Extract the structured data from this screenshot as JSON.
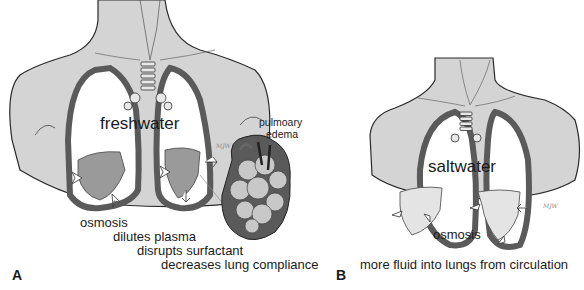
{
  "panels": [
    {
      "id": "A",
      "label": "A",
      "title": "freshwater",
      "inset_label": "pulmoary\nedema",
      "inset_label_line1": "pulmoary",
      "inset_label_line2": "edema",
      "effects": [
        "osmosis",
        "dilutes plasma",
        "disrupts surfactant",
        "decreases lung compliance"
      ],
      "signature": "MJW"
    },
    {
      "id": "B",
      "label": "B",
      "title": "saltwater",
      "inner_label": "osmosis",
      "effects": [
        "more fluid into lungs from circulation"
      ],
      "signature": "MJW"
    }
  ],
  "colors": {
    "body": "#d4d4d4",
    "outline": "#2a2a2a",
    "pleura": "#5a5a5a",
    "lung": "#ffffff",
    "fluid": "#9a9a9a"
  }
}
